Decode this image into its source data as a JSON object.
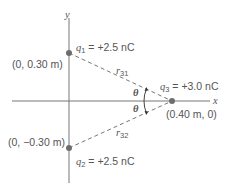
{
  "axes": {
    "x_label": "x",
    "y_label": "y"
  },
  "charges": [
    {
      "name": "q1",
      "symbol": "q",
      "sub": "1",
      "value": "= +2.5 nC",
      "coords": "(0, 0.30 m)"
    },
    {
      "name": "q2",
      "symbol": "q",
      "sub": "2",
      "value": "= +2.5 nC",
      "coords": "(0, −0.30 m)"
    },
    {
      "name": "q3",
      "symbol": "q",
      "sub": "3",
      "value": "= +3.0 nC",
      "coords": "(0.40 m, 0)"
    }
  ],
  "distances": [
    {
      "symbol": "r",
      "sub": "31"
    },
    {
      "symbol": "r",
      "sub": "32"
    }
  ],
  "angle": {
    "symbol": "θ"
  },
  "colors": {
    "line": "#6d6d6d",
    "charge": "#6d6d6d",
    "text": "#555555"
  }
}
